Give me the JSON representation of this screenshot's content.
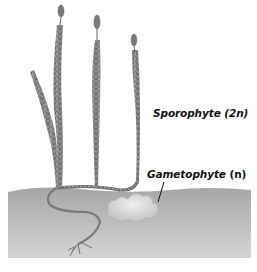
{
  "diagram": {
    "labels": {
      "sporophyte": {
        "name": "Sporophyte",
        "ploidy": "(2n)"
      },
      "gametophyte": {
        "name": "Gametophyte",
        "ploidy": "(n)"
      }
    },
    "colors": {
      "background": "#ffffff",
      "soil_top": "#a8a8a8",
      "soil_bottom": "#d2d2d2",
      "plant": "#6f6f6f",
      "gametophyte": "#d8d8d8",
      "text": "#111111"
    },
    "elements": [
      "sporophyte-shoots",
      "strobili",
      "rhizome",
      "roots",
      "soil",
      "gametophyte",
      "leader-line"
    ]
  }
}
